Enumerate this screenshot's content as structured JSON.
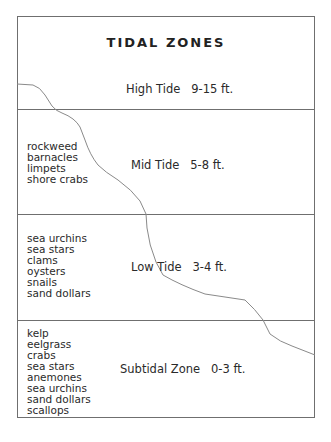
{
  "title": "TIDAL ZONES",
  "colors": {
    "border": "#6f6f6f",
    "curve": "#8a8a8a",
    "text": "#2a2a2a"
  },
  "zones": [
    {
      "name": "High Tide",
      "range": "9-15 ft.",
      "label": "High Tide   9-15 ft.",
      "species": []
    },
    {
      "name": "Mid Tide",
      "range": "5-8 ft.",
      "label": "Mid Tide   5-8 ft.",
      "species": [
        "rockweed",
        "barnacles",
        "limpets",
        "shore crabs"
      ]
    },
    {
      "name": "Low Tide",
      "range": "3-4 ft.",
      "label": "Low Tide   3-4 ft.",
      "species": [
        "sea urchins",
        "sea stars",
        "clams",
        "oysters",
        "snails",
        "sand dollars"
      ]
    },
    {
      "name": "Subtidal Zone",
      "range": "0-3 ft.",
      "label": "Subtidal Zone   0-3 ft.",
      "species": [
        "kelp",
        "eelgrass",
        "crabs",
        "sea stars",
        "anemones",
        "sea urchins",
        "sand dollars",
        "scallops"
      ]
    }
  ],
  "shoreline_curve": "shoreline profile line descending from upper-left to lower-right"
}
